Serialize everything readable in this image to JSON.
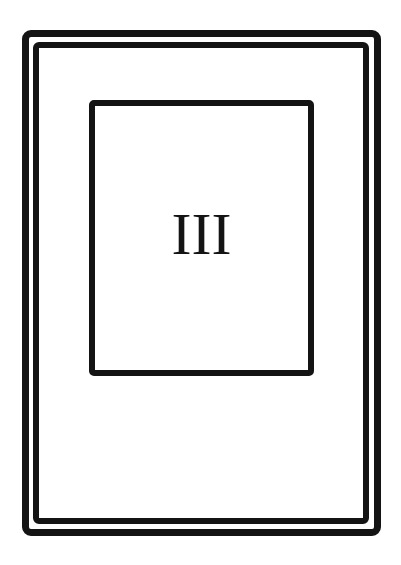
{
  "card": {
    "numeral": "III",
    "ink_color": "#141414",
    "background_color": "#ffffff"
  }
}
